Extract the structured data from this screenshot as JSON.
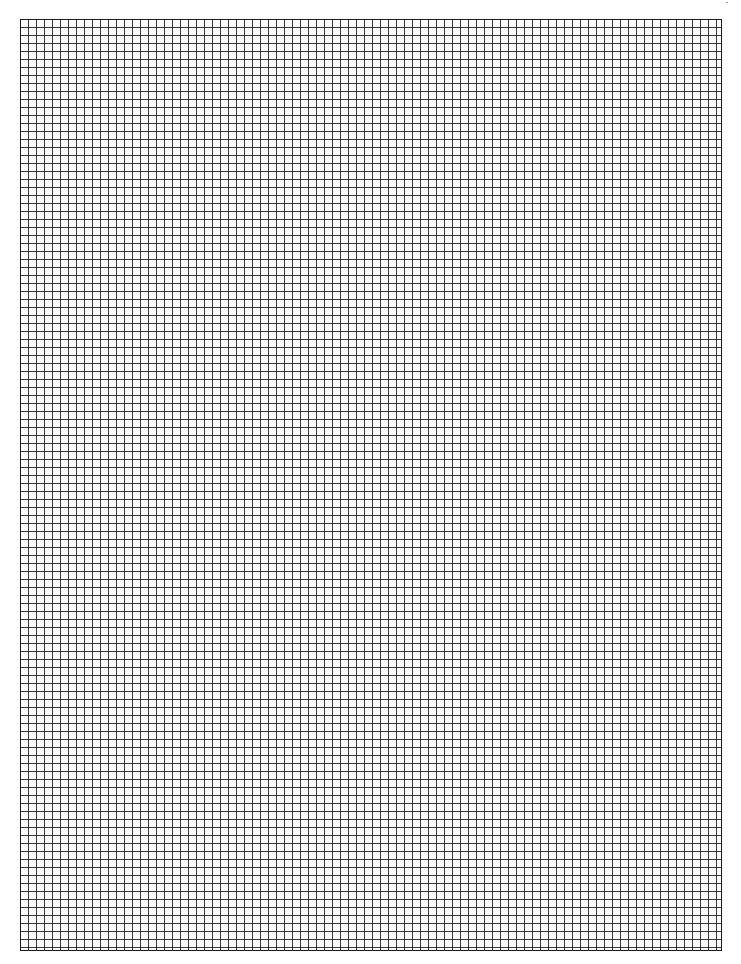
{
  "document": {
    "type": "graph-paper",
    "grid": {
      "cell_size_px": 8,
      "columns": 88,
      "rows": 116,
      "line_color": "#1a1a1a",
      "background_color": "#ffffff"
    }
  }
}
